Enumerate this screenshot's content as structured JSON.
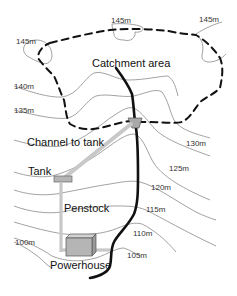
{
  "diagram": {
    "type": "micro-hydro scheme site map with contour lines",
    "labels": {
      "catchment": "Catchment area",
      "channel": "Channel to tank",
      "tank": "Tank",
      "penstock": "Penstock",
      "powerhouse": "Powerhouse"
    },
    "elevations": [
      {
        "id": "e145a",
        "text": "145m"
      },
      {
        "id": "e145b",
        "text": "145m"
      },
      {
        "id": "e145c",
        "text": "145m"
      },
      {
        "id": "e140",
        "text": "140m"
      },
      {
        "id": "e135",
        "text": "135m"
      },
      {
        "id": "e130",
        "text": "130m"
      },
      {
        "id": "e125",
        "text": "125m"
      },
      {
        "id": "e120",
        "text": "120m"
      },
      {
        "id": "e115",
        "text": "115m"
      },
      {
        "id": "e110",
        "text": "110m"
      },
      {
        "id": "e105",
        "text": "105m"
      },
      {
        "id": "e100",
        "text": "100m"
      }
    ],
    "colors": {
      "contour": "#8a8a8a",
      "catchment_boundary": "#111111",
      "stream": "#111111",
      "channel_pipe": "#c8c8c8",
      "structure_fill": "#b5b5b5"
    }
  }
}
